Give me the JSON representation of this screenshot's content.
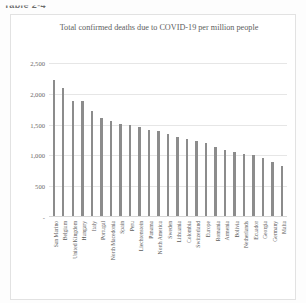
{
  "document": {
    "caption": "Table 2-4"
  },
  "chart_data": {
    "type": "bar",
    "title": "Total confirmed deaths due to COVID-19 per million people",
    "xlabel": "",
    "ylabel": "",
    "ylim": [
      0,
      2500
    ],
    "yticks": [
      "0",
      "500",
      "1,000",
      "1,500",
      "2,000",
      "2,500"
    ],
    "grid": true,
    "legend": "none",
    "bar_color": "#8c8c8c",
    "categories": [
      "San Marino",
      "Belgium",
      "United Kingdom",
      "Hungary",
      "Italy",
      "Portugal",
      "North Macedonia",
      "Spain",
      "Peru",
      "Liechtenstein",
      "Panama",
      "North America",
      "Sweden",
      "Lithuania",
      "Colombia",
      "Switzerland",
      "Europe",
      "Romania",
      "Armenia",
      "Bolivia",
      "Netherlands",
      "Ecuador",
      "Georgia",
      "Germany",
      "Malta"
    ],
    "values": [
      2220,
      2090,
      1890,
      1880,
      1720,
      1600,
      1560,
      1510,
      1490,
      1460,
      1420,
      1390,
      1350,
      1300,
      1270,
      1240,
      1200,
      1140,
      1090,
      1060,
      1030,
      1000,
      960,
      900,
      830
    ]
  }
}
